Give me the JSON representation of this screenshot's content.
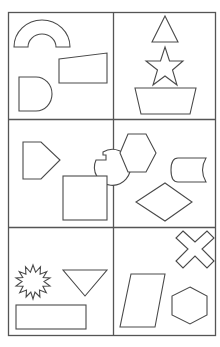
{
  "worksheet": {
    "layout": {
      "columns": 2,
      "rows": 3,
      "border_color": "#555555",
      "stroke_color": "#4a4a4a",
      "background": "#ffffff"
    },
    "cells": [
      {
        "position": "row1-col1",
        "shapes": [
          "semicircular-arch",
          "trapezoid",
          "d-shape"
        ]
      },
      {
        "position": "row1-col2",
        "shapes": [
          "triangle",
          "five-point-star",
          "inverted-trapezoid"
        ]
      },
      {
        "position": "row2-col1",
        "shapes": [
          "pentagon",
          "circle-with-notch",
          "square"
        ]
      },
      {
        "position": "row2-col2",
        "shapes": [
          "hexagon",
          "cylinder",
          "rhombus"
        ]
      },
      {
        "position": "row3-col1",
        "shapes": [
          "starburst",
          "inverted-triangle",
          "rectangle"
        ]
      },
      {
        "position": "row3-col2",
        "shapes": [
          "cross-x",
          "parallelogram",
          "hexagon"
        ]
      }
    ]
  }
}
